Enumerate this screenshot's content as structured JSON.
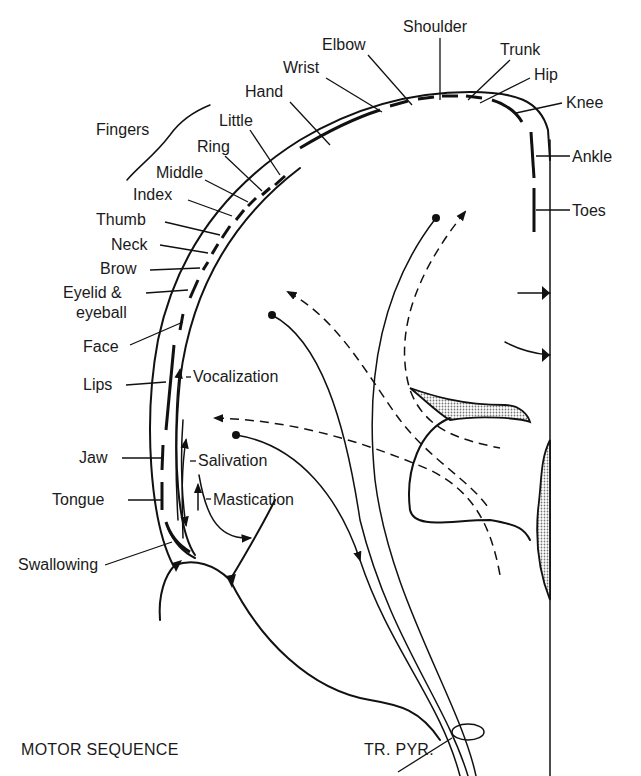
{
  "figure": {
    "caption_left": "MOTOR SEQUENCE",
    "caption_tract": "TR. PYR."
  },
  "labels": {
    "shoulder": "Shoulder",
    "elbow": "Elbow",
    "trunk": "Trunk",
    "wrist": "Wrist",
    "hip": "Hip",
    "hand": "Hand",
    "knee": "Knee",
    "fingers": "Fingers",
    "little": "Little",
    "ring": "Ring",
    "ankle": "Ankle",
    "middle": "Middle",
    "index": "Index",
    "toes": "Toes",
    "thumb": "Thumb",
    "neck": "Neck",
    "brow": "Brow",
    "eyelid_line1": "Eyelid &",
    "eyelid_line2": "eyeball",
    "face": "Face",
    "lips": "Lips",
    "vocalization": "Vocalization",
    "jaw": "Jaw",
    "salivation": "Salivation",
    "tongue": "Tongue",
    "mastication": "Mastication",
    "swallowing": "Swallowing"
  },
  "colors": {
    "ink": "#111111",
    "background": "#ffffff",
    "stipple": "#9a9a9a"
  }
}
